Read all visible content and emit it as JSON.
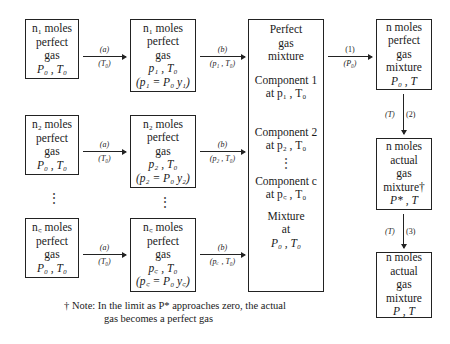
{
  "diagram": {
    "left_boxes": [
      {
        "lines": [
          "n₁ moles",
          "perfect",
          "gas",
          "P₀ , T₀"
        ]
      },
      {
        "lines": [
          "n₂ moles",
          "perfect",
          "gas",
          "P₀ , T₀"
        ]
      },
      {
        "lines": [
          "n꜀ moles",
          "perfect",
          "gas",
          "P₀ , T₀"
        ]
      }
    ],
    "middle_boxes": [
      {
        "lines": [
          "n₁ moles",
          "perfect",
          "gas",
          "p₁ , T₀",
          "(p₁ = P₀ y₁)"
        ]
      },
      {
        "lines": [
          "n₂ moles",
          "perfect",
          "gas",
          "p₂ , T₀",
          "(p₂ = P₀ y₂)"
        ]
      },
      {
        "lines": [
          "n꜀ moles",
          "perfect",
          "gas",
          "p꜀ , T₀",
          "(p꜀ = P₀ y꜀)"
        ]
      }
    ],
    "step_a_labels": [
      {
        "top": "(a)",
        "bottom": "(T₀)"
      },
      {
        "top": "(a)",
        "bottom": "(T₀)"
      },
      {
        "top": "(a)",
        "bottom": "(T₀)"
      }
    ],
    "step_b_labels": [
      {
        "top": "(b)",
        "bottom": "(p₁ , T₀)"
      },
      {
        "top": "(b)",
        "bottom": "(p₂ , T₀)"
      },
      {
        "top": "(b)",
        "bottom": "(p꜀ , T₀)"
      }
    ],
    "mixture_box": {
      "title": [
        "Perfect",
        "gas",
        "mixture"
      ],
      "component1": [
        "Component 1",
        "at p₁ , T₀"
      ],
      "component2": [
        "Component 2",
        "at p₂ , T₀"
      ],
      "componentc": [
        "Component c",
        "at p꜀ , T₀"
      ],
      "mixture": [
        "Mixture",
        "at",
        "P₀ , T₀"
      ]
    },
    "step_1_label": {
      "top": "(1)",
      "bottom": "(P₀)"
    },
    "right_boxes": [
      {
        "lines": [
          "n moles",
          "perfect",
          "gas",
          "mixture",
          "P₀ , T"
        ]
      },
      {
        "lines": [
          "n moles",
          "actual",
          "gas",
          "mixture†",
          "P* , T"
        ]
      },
      {
        "lines": [
          "n moles",
          "actual",
          "gas",
          "mixture",
          "P , T"
        ]
      }
    ],
    "step_2_label": {
      "left": "(T)",
      "right": "(2)"
    },
    "step_3_label": {
      "left": "(T)",
      "right": "(3)"
    },
    "ellipsis": "⋮",
    "note": {
      "line1": "† Note:  In the limit as P* approaches zero, the actual",
      "line2": "gas becomes a perfect gas"
    }
  }
}
